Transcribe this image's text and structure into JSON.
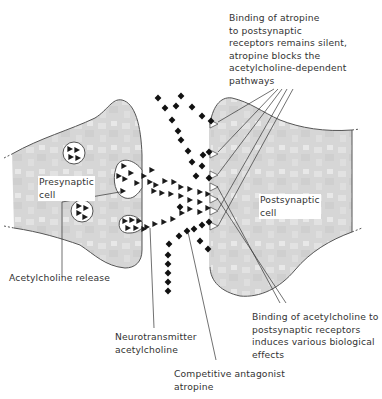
{
  "diagram": {
    "colors": {
      "cell_fill": "#d9d9d9",
      "cell_outline": "#555555",
      "vesicle_fill": "#ffffff",
      "acetylcholine_marker": "#1a1a1a",
      "atropine_marker": "#111111",
      "leader_line": "#333333",
      "text": "#333333"
    },
    "legend": {
      "acetylcholine_symbol": "triangle",
      "atropine_symbol": "diamond"
    },
    "labels": {
      "presynaptic_cell": "Presynaptic\ncell",
      "postsynaptic_cell": "Postsynaptic\ncell",
      "acetylcholine_release": "Acetylcholine release",
      "neurotransmitter": "Neurotransmitter\nacetylcholine",
      "antagonist": "Competitive antagonist\natropine",
      "atropine_binding": "Binding of atropine\nto postsynaptic\nreceptors remains silent,\natropine blocks the\nacetylcholine-dependent\npathways",
      "acetylcholine_binding": "Binding of acetylcholine to\npostsynaptic receptors\ninduces various biological\neffects"
    }
  }
}
